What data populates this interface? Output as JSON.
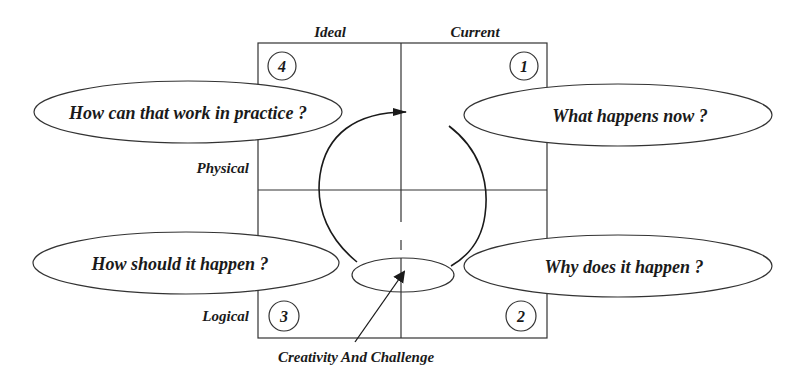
{
  "diagram": {
    "column_labels": {
      "left": "Ideal",
      "right": "Current"
    },
    "row_labels": {
      "top": "Physical",
      "bottom": "Logical"
    },
    "quadrant_numbers": {
      "top_right": "1",
      "bottom_right": "2",
      "bottom_left": "3",
      "top_left": "4"
    },
    "questions": {
      "q1": "What happens now ?",
      "q2": "Why does it happen ?",
      "q3": "How should it happen ?",
      "q4": "How can that work in practice ?"
    },
    "center_annotation": "Creativity And Challenge",
    "colors": {
      "stroke": "#333333",
      "text": "#1a1a1a",
      "background": "#ffffff"
    }
  }
}
